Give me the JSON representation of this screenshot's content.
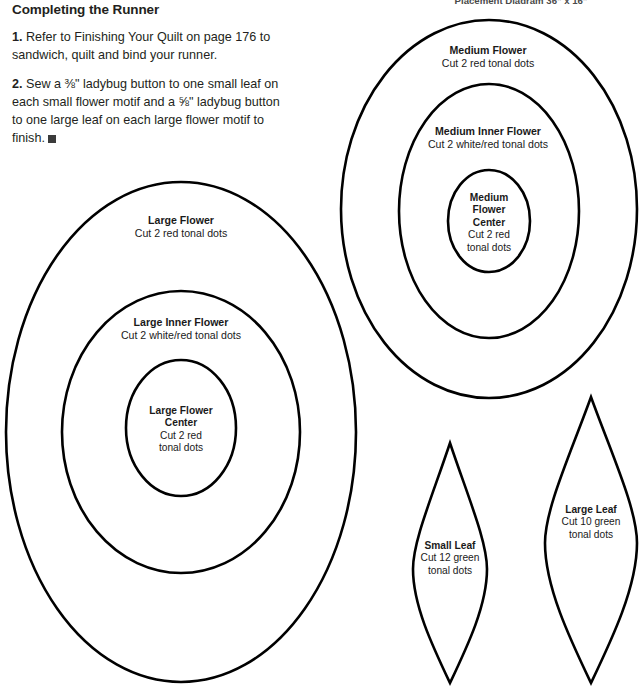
{
  "document": {
    "type": "quilting-pattern-template-page",
    "background_color": "#ffffff",
    "ink_color": "#000000"
  },
  "clipped_caption": {
    "text": "Placement Diagram 36\" x 16\""
  },
  "instructions": {
    "heading": "Completing the Runner",
    "steps": [
      {
        "number": "1.",
        "text": " Refer to Finishing Your Quilt on page 176 to sandwich, quilt and bind your runner."
      },
      {
        "number": "2.",
        "text": " Sew a ⅜\" ladybug button to one small leaf on each small flower motif and a ⅝\" ladybug button to one large leaf on each large flower motif to finish."
      }
    ],
    "end_mark": "■"
  },
  "templates": [
    {
      "id": "large-flower",
      "title": "Large Flower",
      "subtitle": "Cut 2 red tonal dots",
      "shape": "ellipse",
      "cut_count": 2,
      "fabric": "red tonal dots"
    },
    {
      "id": "large-inner-flower",
      "title": "Large Inner Flower",
      "subtitle": "Cut 2 white/red tonal dots",
      "shape": "ellipse",
      "cut_count": 2,
      "fabric": "white/red tonal dots"
    },
    {
      "id": "large-flower-center",
      "title_line1": "Large Flower",
      "title_line2": "Center",
      "subtitle_line1": "Cut 2 red",
      "subtitle_line2": "tonal dots",
      "shape": "ellipse",
      "cut_count": 2,
      "fabric": "red tonal dots"
    },
    {
      "id": "medium-flower",
      "title": "Medium Flower",
      "subtitle": "Cut 2 red tonal dots",
      "shape": "ellipse",
      "cut_count": 2,
      "fabric": "red tonal dots"
    },
    {
      "id": "medium-inner-flower",
      "title": "Medium Inner Flower",
      "subtitle": "Cut 2 white/red tonal dots",
      "shape": "ellipse",
      "cut_count": 2,
      "fabric": "white/red tonal dots"
    },
    {
      "id": "medium-flower-center",
      "title_line1": "Medium",
      "title_line2": "Flower",
      "title_line3": "Center",
      "subtitle_line1": "Cut 2 red",
      "subtitle_line2": "tonal dots",
      "shape": "ellipse",
      "cut_count": 2,
      "fabric": "red tonal dots"
    },
    {
      "id": "small-leaf",
      "title": "Small Leaf",
      "subtitle_line1": "Cut 12 green",
      "subtitle_line2": "tonal dots",
      "shape": "leaf",
      "cut_count": 12,
      "fabric": "green tonal dots"
    },
    {
      "id": "large-leaf",
      "title": "Large Leaf",
      "subtitle_line1": "Cut 10 green",
      "subtitle_line2": "tonal dots",
      "shape": "leaf",
      "cut_count": 10,
      "fabric": "green tonal dots"
    }
  ]
}
